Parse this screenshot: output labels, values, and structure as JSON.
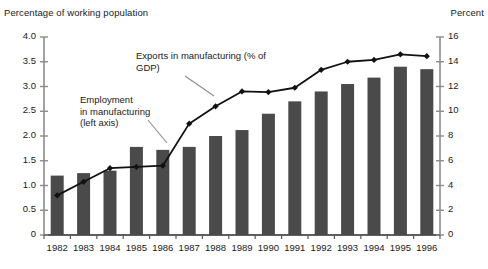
{
  "left_axis_title": "Percentage of working population",
  "right_axis_title": "Percent",
  "annotations": {
    "exports": "Exports in manufacturing (% of\nGDP)",
    "employment": "Employment\nin manufacturing\n(left axis)"
  },
  "colors": {
    "bar": "#4a4a4a",
    "line": "#111111",
    "axis": "#8c8c8c",
    "text": "#1a1a1a",
    "background": "#ffffff",
    "leader": "#8c8c8c"
  },
  "chart_data": {
    "type": "bar",
    "title": "",
    "subtitle": "",
    "xlabel": "",
    "ylabel": "Percentage of working population",
    "y2label": "Percent",
    "grid": false,
    "legend": "annotations",
    "categories": [
      "1982",
      "1983",
      "1984",
      "1985",
      "1986",
      "1987",
      "1988",
      "1989",
      "1990",
      "1991",
      "1992",
      "1993",
      "1994",
      "1995",
      "1996"
    ],
    "ylim": [
      0,
      4.0
    ],
    "yticks": [
      "0",
      "0.5",
      "1.0",
      "1.5",
      "2.0",
      "2.5",
      "3.0",
      "3.5",
      "4.0"
    ],
    "ytick_values": [
      0,
      0.5,
      1.0,
      1.5,
      2.0,
      2.5,
      3.0,
      3.5,
      4.0
    ],
    "y2lim": [
      0,
      16
    ],
    "y2ticks": [
      "0",
      "2",
      "4",
      "6",
      "8",
      "10",
      "12",
      "14",
      "16"
    ],
    "y2tick_values": [
      0,
      2,
      4,
      6,
      8,
      10,
      12,
      14,
      16
    ],
    "series": [
      {
        "name": "Employment in manufacturing (left axis)",
        "type": "bar",
        "axis": "left",
        "values": [
          1.2,
          1.25,
          1.3,
          1.78,
          1.72,
          1.78,
          2.0,
          2.12,
          2.45,
          2.7,
          2.9,
          3.05,
          3.18,
          3.4,
          3.35
        ]
      },
      {
        "name": "Exports in manufacturing (% of GDP)",
        "type": "line",
        "axis": "right",
        "values": [
          3.2,
          4.3,
          5.4,
          5.5,
          5.6,
          9.0,
          10.4,
          11.6,
          11.55,
          11.9,
          13.35,
          14.0,
          14.15,
          14.6,
          14.45
        ]
      }
    ]
  }
}
